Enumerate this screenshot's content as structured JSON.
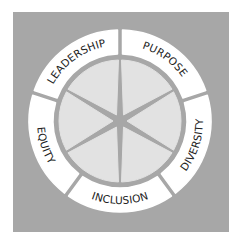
{
  "diagram": {
    "type": "segmented-wheel",
    "colors": {
      "page_background": "#ffffff",
      "panel_background": "#a7a7a7",
      "ring_segment_fill": "#ffffff",
      "inner_wedge_fill": "#e2e2e2",
      "spoke_color": "#a7a7a7",
      "label_color": "#222222"
    },
    "ring_segments": [
      {
        "label": "PURPOSE"
      },
      {
        "label": "DIVERSITY"
      },
      {
        "label": "INCLUSION"
      },
      {
        "label": "EQUITY"
      },
      {
        "label": "LEADERSHIP"
      }
    ],
    "inner_wedge_count": 6
  }
}
